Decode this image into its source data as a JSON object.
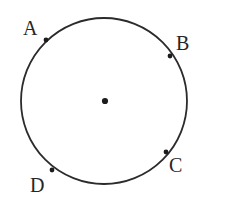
{
  "figure": {
    "name": "circle-with-four-labeled-points",
    "background_color": "#ffffff",
    "stroke_color": "#2b2b2b",
    "label_color": "#262626",
    "width": 241,
    "height": 220
  },
  "circle": {
    "center_x": 104,
    "center_y": 101,
    "radius": 83,
    "stroke_width": 1.8
  },
  "center_point": {
    "label": "",
    "x": 105,
    "y": 101,
    "radius": 3.1
  },
  "points": [
    {
      "label": "A",
      "x": 46,
      "y": 40,
      "dot_radius": 2.4,
      "label_x": 23,
      "label_y": 18
    },
    {
      "label": "B",
      "x": 170,
      "y": 56,
      "dot_radius": 2.4,
      "label_x": 176,
      "label_y": 33
    },
    {
      "label": "C",
      "x": 166,
      "y": 152,
      "dot_radius": 2.4,
      "label_x": 169,
      "label_y": 155
    },
    {
      "label": "D",
      "x": 52,
      "y": 170,
      "dot_radius": 2.4,
      "label_x": 30,
      "label_y": 175
    }
  ]
}
